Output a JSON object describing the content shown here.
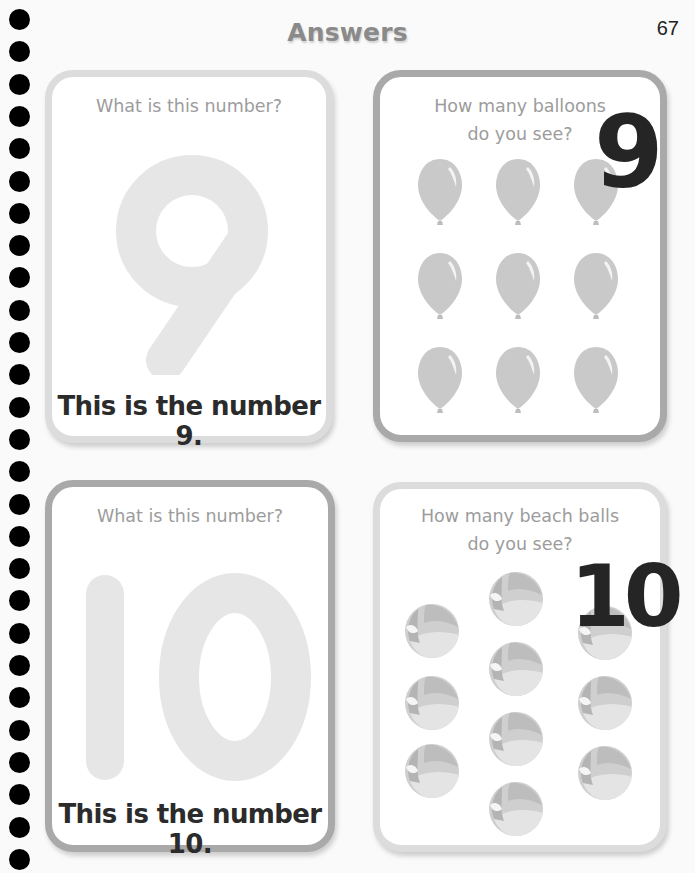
{
  "page": {
    "title": "Answers",
    "number": "67"
  },
  "spiral": {
    "dot_count": 27,
    "dot_color": "#000000"
  },
  "cards": [
    {
      "id": "number-9",
      "question": "What is this number?",
      "digit": "9",
      "answer": "This is the number 9."
    },
    {
      "id": "balloons",
      "question_line1": "How many balloons",
      "question_line2": "do you see?",
      "answer": "9",
      "item": "balloon",
      "count": 9
    },
    {
      "id": "number-10",
      "question": "What is this number?",
      "digit": "10",
      "answer": "This is the number 10."
    },
    {
      "id": "beach-balls",
      "question_line1": "How many beach balls",
      "question_line2": "do you see?",
      "answer": "10",
      "item": "beach ball",
      "count": 10
    }
  ],
  "colors": {
    "card_border_light": "#dcdcdc",
    "card_border_dark": "#a9a9a9",
    "question_text": "#9c9c9c",
    "answer_text": "#2b2b2b",
    "ghost_digit": "#e6e6e6",
    "balloon": "#c8c8c8"
  }
}
